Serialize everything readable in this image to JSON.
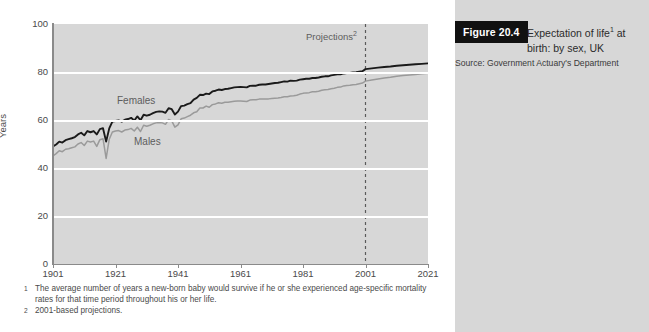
{
  "caption": {
    "figure_tag": "Figure 20.4",
    "title_line1": "Expectation of life",
    "title_sup": "1",
    "title_line1_tail": " at",
    "title_line2": "birth: by sex, UK",
    "source": "Source: Government Actuary's Department"
  },
  "footnotes": [
    {
      "marker": "1",
      "text": "The average number of years a new-born baby would survive if he or she experienced age-specific mortality rates for that time period throughout his or her life."
    },
    {
      "marker": "2",
      "text": "2001-based projections."
    }
  ],
  "annotations": {
    "projections_label": "Projections",
    "projections_sup": "2"
  },
  "colors": {
    "plot_background": "#d7d7d7",
    "gridline": "#ffffff",
    "females_line": "#1a1a1a",
    "males_line": "#9a9a9a",
    "axis": "#8a8a8a",
    "caption_panel": "#d7d7d7",
    "figure_tag_background": "#111111",
    "figure_tag_text": "#ffffff",
    "text": "#4a4a4a"
  },
  "chart_data": {
    "type": "line",
    "xlabel": "",
    "ylabel": "Years",
    "xlim": [
      1901,
      2021
    ],
    "ylim": [
      0,
      100
    ],
    "xticks": [
      1901,
      1921,
      1941,
      1961,
      1981,
      2001,
      2021
    ],
    "yticks": [
      0,
      20,
      40,
      60,
      80,
      100
    ],
    "gridlines": {
      "y": [
        20,
        40,
        60,
        80
      ],
      "x": []
    },
    "legend_position": "inline-labels",
    "annotations": [
      {
        "type": "vline",
        "x": 2001,
        "style": "dashed",
        "label": "Projections"
      }
    ],
    "series": [
      {
        "name": "Females",
        "color": "#1a1a1a",
        "x": [
          1901,
          1902,
          1903,
          1904,
          1905,
          1906,
          1907,
          1908,
          1909,
          1910,
          1911,
          1912,
          1913,
          1914,
          1915,
          1916,
          1917,
          1918,
          1919,
          1920,
          1921,
          1922,
          1923,
          1924,
          1925,
          1926,
          1927,
          1928,
          1929,
          1930,
          1931,
          1932,
          1933,
          1934,
          1935,
          1936,
          1937,
          1938,
          1939,
          1940,
          1941,
          1942,
          1943,
          1944,
          1945,
          1946,
          1947,
          1948,
          1949,
          1950,
          1951,
          1952,
          1953,
          1954,
          1955,
          1956,
          1957,
          1958,
          1959,
          1960,
          1961,
          1962,
          1963,
          1964,
          1965,
          1966,
          1967,
          1968,
          1969,
          1970,
          1971,
          1972,
          1973,
          1974,
          1975,
          1976,
          1977,
          1978,
          1979,
          1980,
          1981,
          1982,
          1983,
          1984,
          1985,
          1986,
          1987,
          1988,
          1989,
          1990,
          1991,
          1992,
          1993,
          1994,
          1995,
          1996,
          1997,
          1998,
          1999,
          2000,
          2001,
          2003,
          2005,
          2007,
          2009,
          2011,
          2013,
          2015,
          2017,
          2019,
          2021
        ],
        "y": [
          49.0,
          49.8,
          51.0,
          50.6,
          51.6,
          52.0,
          52.4,
          52.9,
          54.0,
          54.7,
          53.6,
          55.4,
          54.9,
          55.4,
          54.0,
          56.2,
          56.6,
          51.0,
          56.5,
          59.3,
          59.6,
          59.8,
          59.3,
          60.1,
          60.4,
          60.9,
          59.8,
          61.5,
          59.9,
          62.2,
          61.8,
          62.2,
          62.9,
          63.4,
          63.6,
          63.5,
          63.0,
          64.9,
          64.5,
          62.3,
          63.5,
          65.8,
          66.0,
          66.6,
          67.0,
          68.5,
          69.2,
          70.5,
          70.4,
          71.0,
          70.8,
          71.9,
          72.2,
          72.7,
          72.5,
          72.9,
          73.0,
          73.3,
          73.6,
          73.7,
          73.8,
          73.7,
          73.6,
          74.2,
          74.3,
          74.3,
          74.7,
          74.8,
          74.8,
          75.0,
          75.2,
          75.4,
          75.5,
          75.8,
          76.1,
          76.0,
          76.4,
          76.3,
          76.4,
          76.8,
          77.0,
          77.2,
          77.2,
          77.5,
          77.5,
          77.7,
          78.0,
          78.2,
          78.2,
          78.6,
          78.8,
          79.0,
          79.0,
          79.4,
          79.6,
          79.6,
          79.8,
          79.9,
          80.1,
          80.3,
          81.2,
          81.5,
          81.8,
          82.1,
          82.3,
          82.6,
          82.8,
          83.0,
          83.2,
          83.4,
          83.6
        ]
      },
      {
        "name": "Males",
        "color": "#9a9a9a",
        "x": [
          1901,
          1902,
          1903,
          1904,
          1905,
          1906,
          1907,
          1908,
          1909,
          1910,
          1911,
          1912,
          1913,
          1914,
          1915,
          1916,
          1917,
          1918,
          1919,
          1920,
          1921,
          1922,
          1923,
          1924,
          1925,
          1926,
          1927,
          1928,
          1929,
          1930,
          1931,
          1932,
          1933,
          1934,
          1935,
          1936,
          1937,
          1938,
          1939,
          1940,
          1941,
          1942,
          1943,
          1944,
          1945,
          1946,
          1947,
          1948,
          1949,
          1950,
          1951,
          1952,
          1953,
          1954,
          1955,
          1956,
          1957,
          1958,
          1959,
          1960,
          1961,
          1962,
          1963,
          1964,
          1965,
          1966,
          1967,
          1968,
          1969,
          1970,
          1971,
          1972,
          1973,
          1974,
          1975,
          1976,
          1977,
          1978,
          1979,
          1980,
          1981,
          1982,
          1983,
          1984,
          1985,
          1986,
          1987,
          1988,
          1989,
          1990,
          1991,
          1992,
          1993,
          1994,
          1995,
          1996,
          1997,
          1998,
          1999,
          2000,
          2001,
          2003,
          2005,
          2007,
          2009,
          2011,
          2013,
          2015,
          2017,
          2019,
          2021
        ],
        "y": [
          45.0,
          46.0,
          47.2,
          46.8,
          47.8,
          48.0,
          48.4,
          48.8,
          50.0,
          50.6,
          49.4,
          51.2,
          50.8,
          51.2,
          49.0,
          51.8,
          52.2,
          44.0,
          52.0,
          55.0,
          55.4,
          55.6,
          55.0,
          55.8,
          56.0,
          56.5,
          55.4,
          57.0,
          55.2,
          57.8,
          57.4,
          57.8,
          58.4,
          58.8,
          59.0,
          58.8,
          58.2,
          60.2,
          59.6,
          57.0,
          58.0,
          60.5,
          60.8,
          61.4,
          62.0,
          63.0,
          63.4,
          65.0,
          65.0,
          65.8,
          65.3,
          66.4,
          66.7,
          67.2,
          67.0,
          67.4,
          67.4,
          67.6,
          67.8,
          67.9,
          67.9,
          67.8,
          67.7,
          68.3,
          68.4,
          68.4,
          68.7,
          68.8,
          68.7,
          68.8,
          69.0,
          69.1,
          69.2,
          69.4,
          69.7,
          69.7,
          70.0,
          70.1,
          70.3,
          70.8,
          71.1,
          71.3,
          71.4,
          71.8,
          71.8,
          72.0,
          72.4,
          72.6,
          72.7,
          73.0,
          73.2,
          73.6,
          73.7,
          74.2,
          74.4,
          74.5,
          74.7,
          74.8,
          75.1,
          75.4,
          76.2,
          76.7,
          77.1,
          77.5,
          77.8,
          78.2,
          78.5,
          78.8,
          79.0,
          79.3,
          79.5
        ]
      }
    ]
  }
}
